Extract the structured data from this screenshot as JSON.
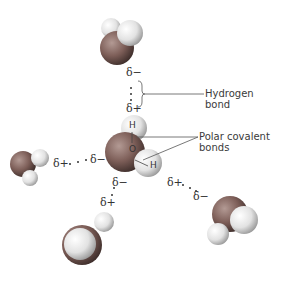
{
  "labels": {
    "hydrogen_bond": [
      "Hydrogen",
      "bond"
    ],
    "polar_covalent": [
      "Polar covalent",
      "bonds"
    ]
  },
  "charges": {
    "top_minus": "δ−",
    "top_plus": "δ+",
    "left_plus": "δ+",
    "left_minus": "δ−",
    "center_left_minus": "δ−",
    "center_bottom_minus": "δ−",
    "bottom_plus": "δ+",
    "right_plus": "δ+",
    "right_minus": "δ−"
  },
  "atoms": {
    "h_top": "H",
    "o_center": "O",
    "h_right": "H"
  },
  "colors": {
    "oxygen": "#7a5a55",
    "hydrogen": "#e8e8e8",
    "line": "#555555"
  }
}
